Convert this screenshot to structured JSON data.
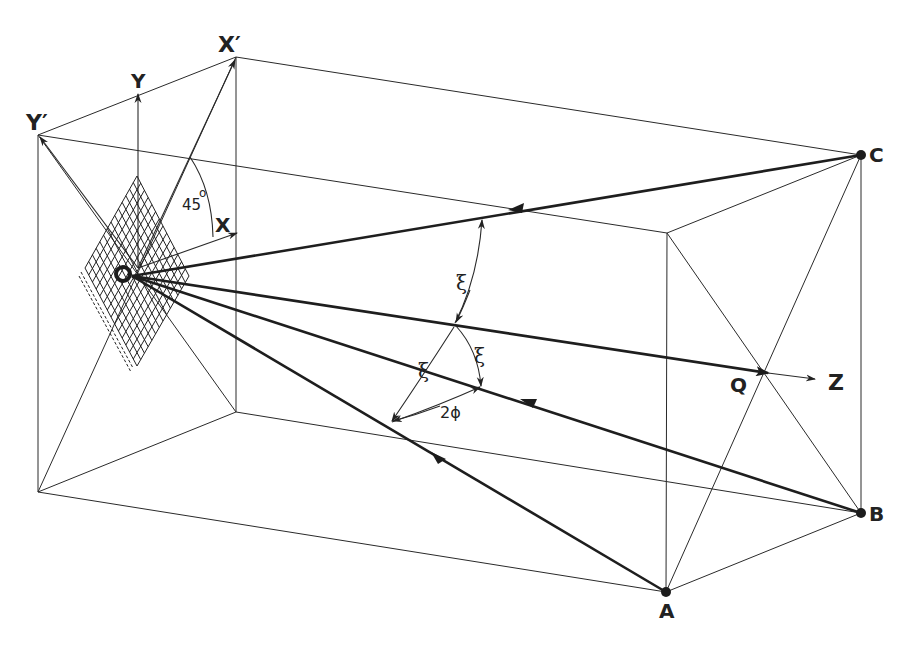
{
  "figure": {
    "type": "3D geometry diagram (oblique projection of a rectangular box)",
    "colors": {
      "ink": "#222222",
      "background": "#ffffff"
    }
  },
  "labels": {
    "origin": "O",
    "x_axis": "X",
    "y_axis": "Y",
    "x_prime": "X′",
    "y_prime": "Y′",
    "z_axis": "Z",
    "point_q": "Q",
    "point_a": "A",
    "point_b": "B",
    "point_c": "C",
    "angle_45": "45",
    "degree": "o",
    "xi_top": "ξ",
    "xi_left": "ξ",
    "xi_right": "ξ",
    "two_phi": "2ϕ"
  },
  "points": {
    "O": [
      128,
      274
    ],
    "Q": [
      763,
      372
    ],
    "A": [
      666,
      592
    ],
    "B": [
      861,
      513
    ],
    "C": [
      861,
      155
    ],
    "X_prime": [
      236,
      57
    ],
    "Y_prime": [
      38,
      135
    ]
  },
  "angles": {
    "axis_rotation": "45°",
    "ray_to_axis": "ξ",
    "azimuth_between_rays": "2ϕ"
  }
}
